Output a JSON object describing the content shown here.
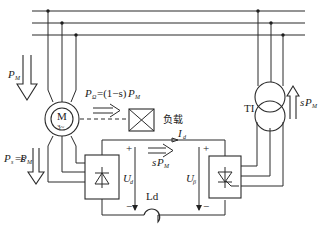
{
  "diagram": {
    "type": "circuit-schematic",
    "colors": {
      "line": "#2a2a2a",
      "background": "#ffffff"
    },
    "labels": {
      "input_power": {
        "main": "P",
        "sub": "M"
      },
      "mech_output": {
        "main": "P",
        "sub1": "Ω",
        "eq": "=(1−s)",
        "main2": "P",
        "sub2": "M"
      },
      "load": "负载",
      "slip_power": {
        "main": "P",
        "sub": "s",
        "eq": "=s",
        "main2": "P",
        "sub2": "M"
      },
      "dc_current": {
        "main": "I",
        "sub": "d"
      },
      "feedback_power": {
        "pre": "s",
        "main": "P",
        "sub": "M"
      },
      "rectifier_voltage": {
        "main": "U",
        "sub": "d"
      },
      "inverter_voltage": {
        "main": "U",
        "sub": "β"
      },
      "inductor": "Ld",
      "transformer": "TI",
      "transformer_power": {
        "pre": "s",
        "main": "P",
        "sub": "M"
      },
      "motor": {
        "letter": "M",
        "phase": "3~"
      },
      "plus": "+",
      "minus": "−"
    },
    "components": [
      "three-phase-bus",
      "wound-rotor-induction-motor",
      "mechanical-load",
      "diode-rectifier",
      "smoothing-inductor",
      "thyristor-inverter",
      "inverter-transformer"
    ]
  }
}
